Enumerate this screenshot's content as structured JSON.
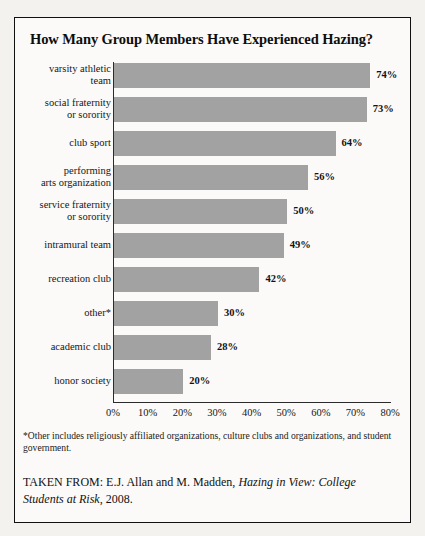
{
  "title": "How Many Group Members Have Experienced Hazing?",
  "footnote": "*Other includes religiously affiliated organizations, culture clubs and organizations, and student government.",
  "attribution": {
    "prefix": "TAKEN FROM: E.J. Allan and M. Madden, ",
    "work_title": "Hazing in View: College Students at Risk",
    "suffix": ", 2008."
  },
  "colors": {
    "bar": "#a2a2a2",
    "axis": "#2b2b2b",
    "frame": "#101010",
    "panel_background": "#fbfaf8",
    "page_background": "#f4f2ee"
  },
  "chart_data": {
    "type": "bar",
    "orientation": "horizontal",
    "title": "How Many Group Members Have Experienced Hazing?",
    "xlabel": "",
    "ylabel": "",
    "xlim": [
      0,
      80
    ],
    "grid": false,
    "legend": false,
    "tick_labels": [
      "0%",
      "10%",
      "20%",
      "30%",
      "40%",
      "50%",
      "60%",
      "70%",
      "80%"
    ],
    "tick_values": [
      0,
      10,
      20,
      30,
      40,
      50,
      60,
      70,
      80
    ],
    "categories": [
      "varsity athletic team",
      "social fraternity or sorority",
      "club sport",
      "performing arts organization",
      "service fraternity or sorority",
      "intramural team",
      "recreation club",
      "other*",
      "academic club",
      "honor society"
    ],
    "category_lines": [
      [
        "varsity athletic",
        "team"
      ],
      [
        "social fraternity",
        "or sorority"
      ],
      [
        "club sport"
      ],
      [
        "performing",
        "arts organization"
      ],
      [
        "service fraternity",
        "or sorority"
      ],
      [
        "intramural team"
      ],
      [
        "recreation club"
      ],
      [
        "other*"
      ],
      [
        "academic club"
      ],
      [
        "honor society"
      ]
    ],
    "values": [
      74,
      73,
      64,
      56,
      50,
      49,
      42,
      30,
      28,
      20
    ],
    "value_labels": [
      "74%",
      "73%",
      "64%",
      "56%",
      "50%",
      "49%",
      "42%",
      "30%",
      "28%",
      "20%"
    ]
  }
}
